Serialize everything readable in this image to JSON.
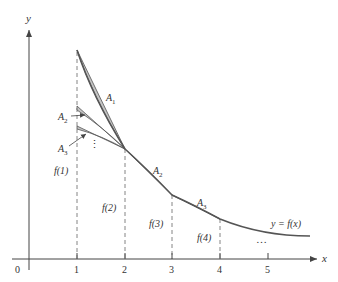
{
  "diagram": {
    "axes": {
      "x_label": "x",
      "y_label": "y",
      "origin_label": "0",
      "x_ticks": [
        "1",
        "2",
        "3",
        "4",
        "5"
      ]
    },
    "curve_label": "y = f(x)",
    "function_values": [
      "f(1)",
      "f(2)",
      "f(3)",
      "f(4)"
    ],
    "region_labels": {
      "A1_main": {
        "base": "A",
        "sub": "1"
      },
      "A2_main": {
        "base": "A",
        "sub": "2"
      },
      "A3_main": {
        "base": "A",
        "sub": "3"
      },
      "A2_shifted": {
        "base": "A",
        "sub": "2"
      },
      "A3_shifted": {
        "base": "A",
        "sub": "3"
      }
    },
    "continuation": {
      "vertical_dots": "⋮",
      "horizontal_dots": "…"
    },
    "colors": {
      "region_fill": "#c4c4c4",
      "stroke": "#555555"
    }
  }
}
